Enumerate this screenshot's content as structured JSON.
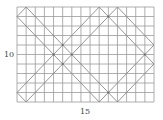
{
  "figure": {
    "grid": {
      "columns": 15,
      "rows": 10
    },
    "labels": {
      "height": "10",
      "width": "15"
    },
    "colors": {
      "grid": "#9a9a9a",
      "path": "#8a8a8a",
      "dot": "#6a6a6a",
      "background": "#ffffff"
    },
    "path_segments": [
      [
        [
          1,
          0
        ],
        [
          11,
          10
        ]
      ],
      [
        [
          0,
          1
        ],
        [
          9,
          10
        ]
      ],
      [
        [
          0,
          9
        ],
        [
          9,
          0
        ]
      ],
      [
        [
          1,
          10
        ],
        [
          11,
          0
        ]
      ],
      [
        [
          9,
          0
        ],
        [
          15,
          6
        ]
      ],
      [
        [
          9,
          10
        ],
        [
          15,
          4
        ]
      ],
      [
        [
          0,
          1
        ],
        [
          1,
          0
        ]
      ],
      [
        [
          0,
          9
        ],
        [
          1,
          10
        ]
      ],
      [
        [
          11,
          0
        ],
        [
          15,
          4
        ]
      ],
      [
        [
          11,
          10
        ],
        [
          15,
          6
        ]
      ]
    ],
    "intersection_points": [
      [
        5,
        4
      ],
      [
        4,
        5
      ],
      [
        6,
        5
      ],
      [
        5,
        6
      ],
      [
        10,
        1
      ],
      [
        10,
        9
      ],
      [
        14,
        5
      ]
    ]
  }
}
